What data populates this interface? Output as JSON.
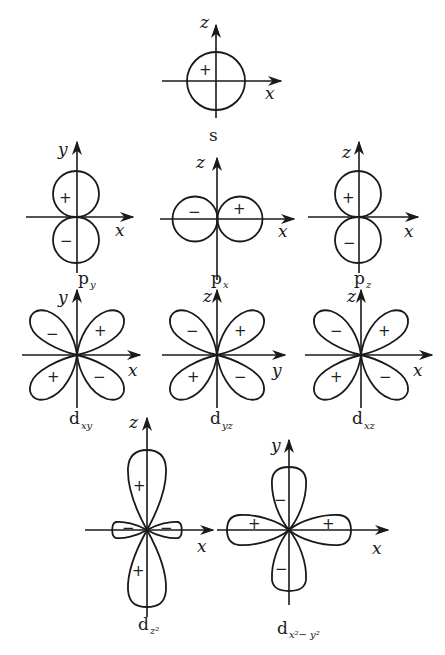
{
  "diagram": {
    "colors": {
      "stroke": "#1a1a1a",
      "background": "#ffffff"
    },
    "orbitals": {
      "s": {
        "name": "s",
        "sub": "",
        "axis_h": "x",
        "axis_v": "z",
        "signs": [
          "+"
        ]
      },
      "py": {
        "name": "p",
        "sub": "y",
        "axis_h": "x",
        "axis_v": "y",
        "signs": [
          "+",
          "−"
        ]
      },
      "px": {
        "name": "p",
        "sub": "x",
        "axis_h": "x",
        "axis_v": "z",
        "signs": [
          "−",
          "+"
        ]
      },
      "pz": {
        "name": "p",
        "sub": "z",
        "axis_h": "x",
        "axis_v": "z",
        "signs": [
          "+",
          "−"
        ]
      },
      "dxy": {
        "name": "d",
        "sub": "xy",
        "axis_h": "x",
        "axis_v": "y",
        "signs": [
          "−",
          "+",
          "+",
          "−"
        ]
      },
      "dyz": {
        "name": "d",
        "sub": "yz",
        "axis_h": "y",
        "axis_v": "z",
        "signs": [
          "−",
          "+",
          "+",
          "−"
        ]
      },
      "dxz": {
        "name": "d",
        "sub": "xz",
        "axis_h": "x",
        "axis_v": "z",
        "signs": [
          "−",
          "+",
          "+",
          "−"
        ]
      },
      "dz2": {
        "name": "d",
        "sub": "z²",
        "axis_h": "x",
        "axis_v": "z",
        "signs": [
          "+",
          "−",
          "−",
          "+"
        ]
      },
      "dx2y2": {
        "name": "d",
        "sub": "x²− y²",
        "axis_h": "x",
        "axis_v": "y",
        "signs": [
          "−",
          "+",
          "+",
          "−"
        ]
      }
    }
  }
}
